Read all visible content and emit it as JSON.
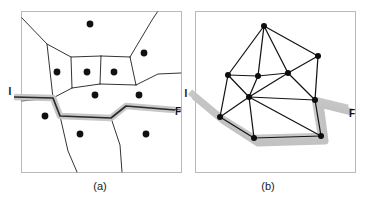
{
  "figure": {
    "width": 373,
    "height": 200,
    "background": "#ffffff",
    "line_color": "#1d1d1d",
    "halo_color": "#c4c4c4",
    "dot_color": "#111111"
  },
  "panels": [
    {
      "id": "panel-a",
      "caption": "(a)",
      "caption_pos": {
        "x": 100,
        "y": 190
      },
      "frame": {
        "x": 21,
        "y": 11,
        "w": 160,
        "h": 161
      },
      "start_label": {
        "text": "I",
        "x": 10,
        "y": 95
      },
      "end_label": {
        "text": "F",
        "x": 178,
        "y": 115
      },
      "type": "voronoi-diagram",
      "sites": [
        {
          "x": 90,
          "y": 24
        },
        {
          "x": 144,
          "y": 53
        },
        {
          "x": 57,
          "y": 72
        },
        {
          "x": 87,
          "y": 72
        },
        {
          "x": 114,
          "y": 72
        },
        {
          "x": 95,
          "y": 95
        },
        {
          "x": 139,
          "y": 95
        },
        {
          "x": 45,
          "y": 116
        },
        {
          "x": 80,
          "y": 134
        },
        {
          "x": 146,
          "y": 134
        }
      ],
      "site_radius": 3.4,
      "edges": [
        "M 21 17 L 47 44 L 53 98",
        "M 47 44 L 71 57 L 101 56",
        "M 101 56 L 130 57",
        "M 130 57 L 152 20 L 158 11",
        "M 130 57 L 136 85",
        "M 101 56 L 100 84",
        "M 71 57 L 72 88",
        "M 72 88 L 100 84",
        "M 100 84 L 136 85",
        "M 136 85 L 158 74 L 181 73",
        "M 72 88 L 53 98",
        "M 53 98 L 21 101",
        "M 53 98 L 60 116 L 68 151 L 77 172",
        "M 60 116 L 111 118",
        "M 111 118 L 120 145 L 122 172",
        "M 111 118 L 126 106 L 181 110"
      ],
      "path": {
        "label_start": "I",
        "label_end": "F",
        "polyline": "M 14 97 L 53 98 L 60 116 L 111 118 L 126 106 L 175 110"
      }
    },
    {
      "id": "panel-b",
      "caption": "(b)",
      "caption_pos": {
        "x": 268,
        "y": 190
      },
      "frame": {
        "x": 195,
        "y": 11,
        "w": 160,
        "h": 161
      },
      "start_label": {
        "text": "I",
        "x": 186,
        "y": 97
      },
      "end_label": {
        "text": "F",
        "x": 352,
        "y": 117
      },
      "type": "delaunay-triangulation",
      "nodes": [
        {
          "id": "n-top",
          "x": 264,
          "y": 26
        },
        {
          "id": "n-right-up",
          "x": 318,
          "y": 56
        },
        {
          "id": "n-left",
          "x": 228,
          "y": 75
        },
        {
          "id": "n-mid-left",
          "x": 258,
          "y": 76
        },
        {
          "id": "n-mid-right",
          "x": 288,
          "y": 73
        },
        {
          "id": "n-hub",
          "x": 249,
          "y": 97
        },
        {
          "id": "n-right-mid",
          "x": 315,
          "y": 100
        },
        {
          "id": "n-bottom-left",
          "x": 220,
          "y": 117
        },
        {
          "id": "n-bottom-mid",
          "x": 254,
          "y": 138
        },
        {
          "id": "n-bottom-right",
          "x": 321,
          "y": 136
        }
      ],
      "node_radius": 3.0,
      "edges": [
        [
          "n-top",
          "n-left"
        ],
        [
          "n-top",
          "n-mid-left"
        ],
        [
          "n-top",
          "n-mid-right"
        ],
        [
          "n-top",
          "n-right-up"
        ],
        [
          "n-right-up",
          "n-mid-right"
        ],
        [
          "n-right-up",
          "n-right-mid"
        ],
        [
          "n-left",
          "n-mid-left"
        ],
        [
          "n-left",
          "n-hub"
        ],
        [
          "n-left",
          "n-bottom-left"
        ],
        [
          "n-mid-left",
          "n-mid-right"
        ],
        [
          "n-mid-left",
          "n-hub"
        ],
        [
          "n-mid-right",
          "n-hub"
        ],
        [
          "n-mid-right",
          "n-right-mid"
        ],
        [
          "n-hub",
          "n-right-mid"
        ],
        [
          "n-hub",
          "n-bottom-left"
        ],
        [
          "n-hub",
          "n-bottom-mid"
        ],
        [
          "n-hub",
          "n-bottom-right"
        ],
        [
          "n-right-mid",
          "n-bottom-right"
        ],
        [
          "n-bottom-left",
          "n-bottom-mid"
        ],
        [
          "n-bottom-mid",
          "n-bottom-right"
        ]
      ],
      "path": {
        "label_start": "I",
        "label_end": "F",
        "polyline": "M 190 92 L 220 117 L 254 138 L 321 136 L 315 100 L 348 108"
      },
      "shadow_polyline": "M 194 96 L 224 121 L 258 143 L 325 141 L 320 104 L 352 112"
    }
  ]
}
